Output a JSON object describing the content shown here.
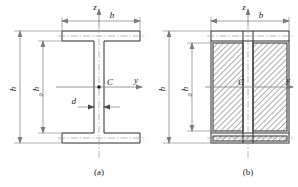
{
  "figure": {
    "background_color": "#ffffff",
    "line_color": "#2b2b2b",
    "dimension_color": "#8c8c8c",
    "hatch_color": "#555555"
  },
  "panels": [
    {
      "id": "a",
      "caption": "(a)",
      "description": "I-beam cross section outline",
      "labels": {
        "axis_z": "z",
        "axis_y": "y",
        "centroid": "C",
        "width_b": "b",
        "height_h": "h",
        "height_h0_base": "h",
        "height_h0_sub": "0",
        "web_thickness_d": "d"
      }
    },
    {
      "id": "b",
      "caption": "(b)",
      "description": "Hatched web area regions of the I-beam",
      "labels": {
        "axis_z": "z",
        "axis_y": "y",
        "centroid": "C",
        "width_b": "b",
        "height_h": "h",
        "height_h0_base": "h",
        "height_h0_sub": "0"
      }
    }
  ],
  "geometry": {
    "panel_a": {
      "flange_left_x": 62,
      "flange_right_x": 140,
      "top_flange_top_y": 31,
      "top_flange_bottom_y": 41,
      "bottom_flange_top_y": 133,
      "bottom_flange_bottom_y": 143,
      "web_left_x": 94,
      "web_right_x": 104,
      "centroid_x": 99,
      "centroid_y": 87
    },
    "panel_b": {
      "outer_left_x": 211,
      "outer_right_x": 289,
      "top_y": 31,
      "bottom_y": 143,
      "web_left_x": 243,
      "web_right_x": 253,
      "centroid_x": 248,
      "centroid_y": 87,
      "hatch_top_y": 43,
      "hatch_bottom_y": 131
    }
  }
}
